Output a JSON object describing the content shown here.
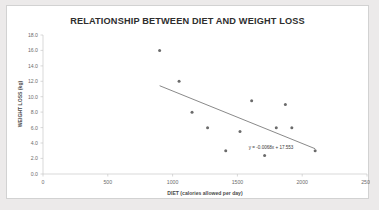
{
  "chart_data": {
    "type": "scatter",
    "title": "RELATIONSHIP BETWEEN DIET AND WEIGHT LOSS",
    "xlabel": "DIET (calories allowed per day)",
    "ylabel": "WEIGHT LOSS (kg)",
    "xlim": [
      0,
      2500
    ],
    "ylim": [
      0.0,
      18.0
    ],
    "xticks": [
      0,
      500,
      1000,
      1500,
      2000,
      2500
    ],
    "xtick_labels": [
      "0",
      "500",
      "1000",
      "1500",
      "2000",
      "2500"
    ],
    "yticks": [
      0.0,
      2.0,
      4.0,
      6.0,
      8.0,
      10.0,
      12.0,
      14.0,
      16.0,
      18.0
    ],
    "ytick_labels": [
      "0.0",
      "2.0",
      "4.0",
      "6.0",
      "8.0",
      "10.0",
      "12.0",
      "14.0",
      "16.0",
      "18.0"
    ],
    "grid": false,
    "legend": false,
    "marker_color": "#6b6b6b",
    "trendline_color": "#6b6b6b",
    "series": [
      {
        "name": "diet vs weight loss",
        "x": [
          900,
          1050,
          1150,
          1270,
          1410,
          1520,
          1610,
          1710,
          1800,
          1870,
          1920,
          2100
        ],
        "y": [
          16.0,
          12.0,
          8.0,
          6.0,
          3.0,
          5.5,
          9.5,
          2.4,
          6.0,
          9.0,
          6.0,
          3.0
        ]
      }
    ],
    "trendline": {
      "equation": "y = -0.0068x + 17.553",
      "slope": -0.0068,
      "intercept": 17.553,
      "x_start": 900,
      "x_end": 2100
    },
    "annotations": [
      {
        "text": "y = -0.0068x + 17.553",
        "x": 1760,
        "y": 3.3
      }
    ]
  }
}
